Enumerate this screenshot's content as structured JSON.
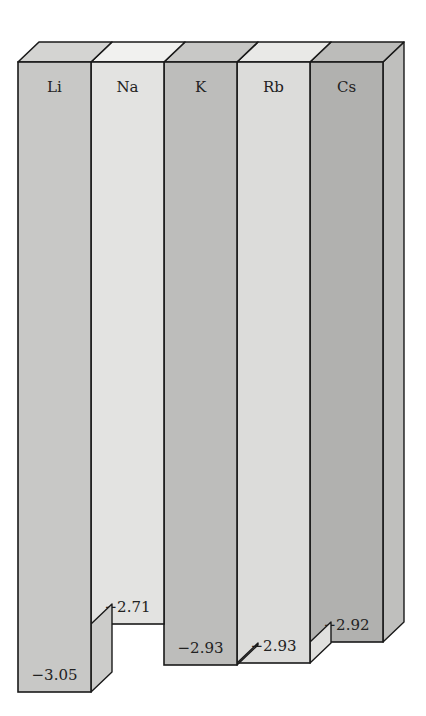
{
  "chart_data": {
    "type": "bar",
    "title": "",
    "subtitle": "",
    "xlabel": "",
    "ylabel": "",
    "orientation": "downward (negative values hang from top)",
    "style": "3D blocks, grayscale",
    "categories": [
      "Li",
      "Na",
      "K",
      "Rb",
      "Cs"
    ],
    "values": [
      -3.05,
      -2.71,
      -2.93,
      -2.93,
      -2.92
    ],
    "value_labels": [
      "−3.05",
      "−2.71",
      "−2.93",
      "−2.93",
      "−2.92"
    ],
    "colors": [
      "#c8c8c6",
      "#e3e3e1",
      "#bdbdbb",
      "#dcdcda",
      "#b1b1af"
    ],
    "grid": false,
    "legend": null,
    "ylim": [
      -3.05,
      -2.0
    ]
  },
  "geometry": {
    "left": 18,
    "col_width": 73,
    "top_front": 62,
    "depth_dx": 21,
    "depth_dy": -20,
    "bottoms": [
      692,
      624,
      665,
      663,
      642
    ]
  }
}
